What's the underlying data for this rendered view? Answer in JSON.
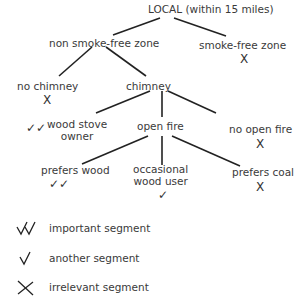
{
  "diagram": {
    "nodes": {
      "root": {
        "label": "LOCAL (within 15 miles)"
      },
      "non_smoke_free": {
        "label": "non smoke-free zone"
      },
      "smoke_free": {
        "label": "smoke-free zone",
        "mark": "X"
      },
      "no_chimney": {
        "label": "no chimney",
        "mark": "X"
      },
      "chimney": {
        "label": "chimney"
      },
      "wood_stove": {
        "label_line1": "wood  stove",
        "label_line2": "owner",
        "mark": "✓✓"
      },
      "open_fire": {
        "label": "open  fire"
      },
      "no_open_fire": {
        "label": "no open fire",
        "mark": "X"
      },
      "prefers_wood": {
        "label": "prefers  wood",
        "mark": "✓✓"
      },
      "occasional": {
        "label_line1": "occasional",
        "label_line2": "wood  user",
        "mark": "✓"
      },
      "prefers_coal": {
        "label": "prefers  coal",
        "mark": "X"
      }
    },
    "edges": [
      [
        "root",
        "non_smoke_free"
      ],
      [
        "root",
        "smoke_free"
      ],
      [
        "non_smoke_free",
        "no_chimney"
      ],
      [
        "non_smoke_free",
        "chimney"
      ],
      [
        "chimney",
        "wood_stove"
      ],
      [
        "chimney",
        "open_fire"
      ],
      [
        "chimney",
        "no_open_fire"
      ],
      [
        "open_fire",
        "prefers_wood"
      ],
      [
        "open_fire",
        "occasional"
      ],
      [
        "open_fire",
        "prefers_coal"
      ]
    ]
  },
  "legend": {
    "items": [
      {
        "symbol": "double-check",
        "label": "important segment"
      },
      {
        "symbol": "check",
        "label": "another segment"
      },
      {
        "symbol": "cross",
        "label": "irrelevant segment"
      }
    ]
  }
}
